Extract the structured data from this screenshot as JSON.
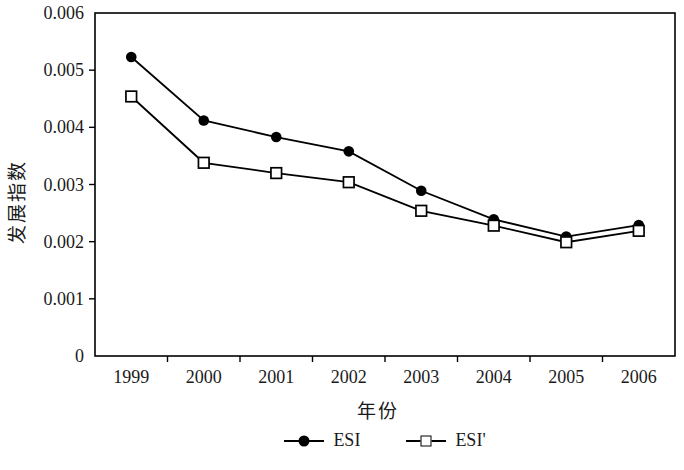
{
  "chart_data": {
    "type": "line",
    "title": "",
    "xlabel": "年份",
    "ylabel": "发展指数",
    "categories": [
      "1999",
      "2000",
      "2001",
      "2002",
      "2003",
      "2004",
      "2005",
      "2006"
    ],
    "series": [
      {
        "name": "ESI",
        "marker": "filled-circle",
        "values": [
          0.00523,
          0.00412,
          0.00383,
          0.00358,
          0.00289,
          0.00239,
          0.00209,
          0.00229
        ]
      },
      {
        "name": "ESI'",
        "marker": "open-square",
        "values": [
          0.00454,
          0.00338,
          0.0032,
          0.00304,
          0.00254,
          0.00228,
          0.00199,
          0.00219
        ]
      }
    ],
    "ylim": [
      0,
      0.006
    ],
    "ytick_step": 0.001,
    "ytick_labels": [
      "0",
      "0.001",
      "0.002",
      "0.003",
      "0.004",
      "0.005",
      "0.006"
    ],
    "grid": false,
    "legend_position": "bottom",
    "line_color": "#000000",
    "background": "#ffffff"
  }
}
